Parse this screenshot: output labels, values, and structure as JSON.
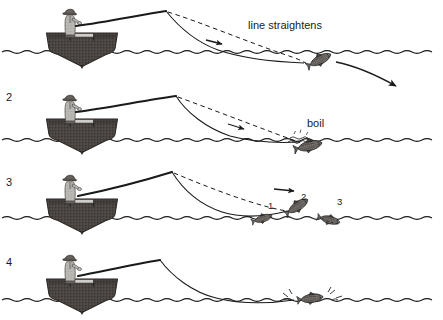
{
  "figure": {
    "background_color": "#ffffff",
    "ink_color": "#1a1a1a",
    "boat_hull_color": "#4a4542",
    "angler_body_color": "#b9b7b4",
    "angler_hat_color": "#55504d",
    "fish_body_color": "#5a5550",
    "width": 443,
    "height": 320
  },
  "panels": [
    {
      "number": "1",
      "number_shown": false,
      "label": "",
      "y_top": 0,
      "waterline_y": 52,
      "annotation": {
        "text": "line straightens",
        "x": 248,
        "y": 26
      },
      "boat": {
        "x": 46,
        "y": 32,
        "width": 72,
        "height": 34
      },
      "angler": {
        "x": 58,
        "y": 6
      },
      "rod_tip": {
        "x": 166,
        "y": 11
      },
      "fish": {
        "x": 318,
        "y": 72,
        "rotation": -25,
        "state": "diving-away"
      },
      "direction_arrow": {
        "from_x": 345,
        "from_y": 63,
        "to_x": 398,
        "to_y": 87
      },
      "line_arrow": {
        "x": 218,
        "y": 41
      }
    },
    {
      "number": "2",
      "number_shown": true,
      "number_x": 6,
      "number_y": 97,
      "y_top": 84,
      "waterline_y": 140,
      "annotation": {
        "text": "boil",
        "x": 310,
        "y": 124
      },
      "boat": {
        "x": 46,
        "y": 118,
        "width": 72,
        "height": 34
      },
      "angler": {
        "x": 58,
        "y": 92
      },
      "rod_tip": {
        "x": 176,
        "y": 96
      },
      "fish": {
        "x": 300,
        "y": 150,
        "rotation": -12,
        "state": "rolling-at-surface"
      },
      "boil_mark": {
        "x": 300,
        "y": 142
      },
      "line_arrow": {
        "x": 240,
        "y": 125
      }
    },
    {
      "number": "3",
      "number_shown": true,
      "number_x": 6,
      "number_y": 182,
      "y_top": 166,
      "waterline_y": 218,
      "annotation": {
        "text": "",
        "x": 0,
        "y": 0
      },
      "boat": {
        "x": 46,
        "y": 198,
        "width": 72,
        "height": 34
      },
      "angler": {
        "x": 58,
        "y": 172
      },
      "rod_tip": {
        "x": 172,
        "y": 172
      },
      "jumping_fish": [
        {
          "label": "1",
          "x": 262,
          "y": 224,
          "label_x": 269,
          "label_y": 206,
          "rotation": -18
        },
        {
          "label": "2",
          "x": 293,
          "y": 215,
          "label_x": 303,
          "label_y": 198,
          "rotation": -32
        },
        {
          "label": "3",
          "x": 327,
          "y": 219,
          "label_x": 339,
          "label_y": 203,
          "rotation": 14
        }
      ],
      "line_arrow": {
        "x": 290,
        "y": 188
      }
    },
    {
      "number": "4",
      "number_shown": true,
      "number_x": 6,
      "number_y": 262,
      "y_top": 246,
      "waterline_y": 300,
      "annotation": {
        "text": "",
        "x": 0,
        "y": 0
      },
      "boat": {
        "x": 46,
        "y": 278,
        "width": 72,
        "height": 34
      },
      "angler": {
        "x": 58,
        "y": 252
      },
      "rod_tip": {
        "x": 160,
        "y": 260
      },
      "fish": {
        "x": 310,
        "y": 299,
        "rotation": -8,
        "state": "thrashing-at-surface"
      },
      "splash": {
        "x": 310,
        "y": 296
      }
    }
  ],
  "legend": {
    "solid_line_meaning": "fishing line under tension",
    "dashed_line_meaning": "previous line position"
  }
}
